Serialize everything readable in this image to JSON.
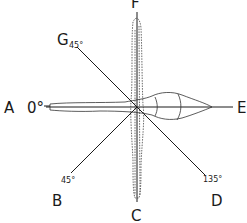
{
  "diagram": {
    "type": "orientation-axes",
    "colors": {
      "line": "#1a1a1a",
      "background": "#ffffff"
    },
    "axes": [
      {
        "id": "A-E",
        "from": "A",
        "to": "E",
        "orientation": "horizontal"
      },
      {
        "id": "F-C",
        "from": "F",
        "to": "C",
        "orientation": "vertical"
      },
      {
        "id": "G-D",
        "from": "G",
        "to": "D",
        "orientation": "diagonal"
      },
      {
        "id": "B-center",
        "from": "B",
        "to": "center",
        "orientation": "diagonal"
      }
    ],
    "labels": {
      "A": "A",
      "B": "B",
      "C": "C",
      "D": "D",
      "E": "E",
      "F": "F",
      "G": "G"
    },
    "angles": {
      "A": "0°",
      "G": "45°",
      "B": "45°",
      "D": "135°"
    }
  }
}
